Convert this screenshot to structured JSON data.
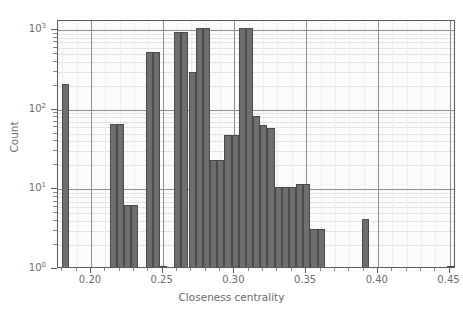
{
  "chart_data": {
    "type": "bar",
    "title": "",
    "xlabel": "Closeness centrality",
    "ylabel": "Count",
    "yscale": "log",
    "xlim": [
      0.177,
      0.4545
    ],
    "ylim": [
      1,
      1300
    ],
    "grid": true,
    "legend": null,
    "bin_width": 0.005,
    "xticks": [
      "0.20",
      "0.25",
      "0.30",
      "0.35",
      "0.40",
      "0.45"
    ],
    "xtick_values": [
      0.2,
      0.25,
      0.3,
      0.35,
      0.4,
      0.45
    ],
    "yticks": [
      "10⁰",
      "10¹",
      "10²",
      "10³"
    ],
    "ytick_values": [
      1,
      10,
      100,
      1000
    ],
    "bins": [
      {
        "x0": 0.18,
        "x1": 0.185,
        "count": 200
      },
      {
        "x0": 0.213,
        "x1": 0.218,
        "count": 63
      },
      {
        "x0": 0.218,
        "x1": 0.223,
        "count": 63
      },
      {
        "x0": 0.223,
        "x1": 0.228,
        "count": 6
      },
      {
        "x0": 0.228,
        "x1": 0.233,
        "count": 6
      },
      {
        "x0": 0.238,
        "x1": 0.243,
        "count": 500
      },
      {
        "x0": 0.243,
        "x1": 0.248,
        "count": 500
      },
      {
        "x0": 0.248,
        "x1": 0.253,
        "count": 1
      },
      {
        "x0": 0.258,
        "x1": 0.263,
        "count": 900
      },
      {
        "x0": 0.263,
        "x1": 0.268,
        "count": 900
      },
      {
        "x0": 0.268,
        "x1": 0.273,
        "count": 280
      },
      {
        "x0": 0.273,
        "x1": 0.278,
        "count": 1000
      },
      {
        "x0": 0.278,
        "x1": 0.283,
        "count": 1000
      },
      {
        "x0": 0.283,
        "x1": 0.288,
        "count": 22
      },
      {
        "x0": 0.288,
        "x1": 0.293,
        "count": 22
      },
      {
        "x0": 0.293,
        "x1": 0.298,
        "count": 45
      },
      {
        "x0": 0.298,
        "x1": 0.303,
        "count": 45
      },
      {
        "x0": 0.303,
        "x1": 0.308,
        "count": 1000
      },
      {
        "x0": 0.308,
        "x1": 0.313,
        "count": 1000
      },
      {
        "x0": 0.313,
        "x1": 0.318,
        "count": 78
      },
      {
        "x0": 0.318,
        "x1": 0.323,
        "count": 60
      },
      {
        "x0": 0.323,
        "x1": 0.328,
        "count": 55
      },
      {
        "x0": 0.328,
        "x1": 0.333,
        "count": 10
      },
      {
        "x0": 0.333,
        "x1": 0.338,
        "count": 10
      },
      {
        "x0": 0.338,
        "x1": 0.343,
        "count": 10
      },
      {
        "x0": 0.343,
        "x1": 0.348,
        "count": 11
      },
      {
        "x0": 0.348,
        "x1": 0.353,
        "count": 11
      },
      {
        "x0": 0.353,
        "x1": 0.358,
        "count": 3
      },
      {
        "x0": 0.358,
        "x1": 0.363,
        "count": 3
      },
      {
        "x0": 0.389,
        "x1": 0.394,
        "count": 4
      },
      {
        "x0": 0.448,
        "x1": 0.453,
        "count": 1
      }
    ]
  },
  "axes": {
    "y_title": "Count",
    "x_title": "Closeness centrality",
    "y_tick_labels": [
      {
        "mantissa": "10",
        "exponent": "3",
        "value": 1000
      },
      {
        "mantissa": "10",
        "exponent": "2",
        "value": 100
      },
      {
        "mantissa": "10",
        "exponent": "1",
        "value": 10
      },
      {
        "mantissa": "10",
        "exponent": "0",
        "value": 1
      }
    ],
    "x_tick_labels": [
      "0.20",
      "0.25",
      "0.30",
      "0.35",
      "0.40",
      "0.45"
    ]
  },
  "style": {
    "bar_fill": "#6e6e6e",
    "bar_edge": "#4a4a4a",
    "grid_major": "#8e8e8e",
    "grid_minor": "#e2e2e2",
    "axis_text": "#6b6b6b",
    "plot_bg": "#fbfbfb",
    "figure_bg": "#ffffff"
  }
}
